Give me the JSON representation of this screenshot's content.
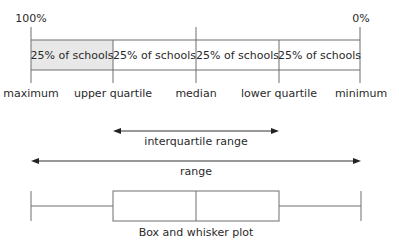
{
  "scale": {
    "left_percent": "100%",
    "right_percent": "0%"
  },
  "segments": [
    {
      "label": "25% of schools",
      "shaded": true
    },
    {
      "label": "25% of schools",
      "shaded": false
    },
    {
      "label": "25% of schools",
      "shaded": false
    },
    {
      "label": "25% of schools",
      "shaded": false
    }
  ],
  "markers": {
    "maximum": "maximum",
    "upper_quartile": "upper quartile",
    "median": "median",
    "lower_quartile": "lower quartile",
    "minimum": "minimum"
  },
  "ranges": {
    "interquartile": "interquartile range",
    "range": "range"
  },
  "plot": {
    "caption": "Box and whisker plot"
  },
  "colors": {
    "line": "#6e6e6e",
    "shaded_cell": "#e8e8e8",
    "text": "#2a2a2a"
  }
}
